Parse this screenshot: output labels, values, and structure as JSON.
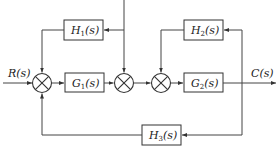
{
  "diagram": {
    "type": "block-diagram",
    "input": {
      "label": "R(s)",
      "name": "R",
      "arg": "(s)"
    },
    "output": {
      "label": "C(s)",
      "name": "C",
      "arg": "(s)"
    },
    "blocks": [
      {
        "id": "G1",
        "label": "G1(s)",
        "name": "G",
        "sub": "1",
        "arg": "(s)",
        "path": "forward"
      },
      {
        "id": "G2",
        "label": "G2(s)",
        "name": "G",
        "sub": "2",
        "arg": "(s)",
        "path": "forward"
      },
      {
        "id": "H1",
        "label": "H1(s)",
        "name": "H",
        "sub": "1",
        "arg": "(s)",
        "path": "feedback"
      },
      {
        "id": "H2",
        "label": "H2(s)",
        "name": "H",
        "sub": "2",
        "arg": "(s)",
        "path": "feedback"
      },
      {
        "id": "H3",
        "label": "H3(s)",
        "name": "H",
        "sub": "3",
        "arg": "(s)",
        "path": "feedback"
      }
    ],
    "summing_junctions": [
      {
        "id": "S1",
        "inputs": [
          "R(s)",
          "H1 output",
          "H3 output"
        ]
      },
      {
        "id": "S2",
        "inputs": [
          "G1 output",
          "external input from top"
        ]
      },
      {
        "id": "S3",
        "inputs": [
          "S2 output",
          "H2 output"
        ]
      }
    ],
    "connections": [
      "R(s) -> S1",
      "S1 -> G1",
      "G1 -> S2",
      "top input -> S2",
      "S2 -> S3",
      "S3 -> G2",
      "G2 -> C(s)",
      "C(s) -> H2 -> S3",
      "C(s) -> H3 -> S1",
      "top input -> H1 -> S1"
    ]
  }
}
